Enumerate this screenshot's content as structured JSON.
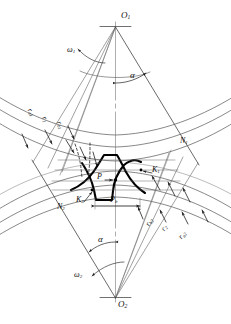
{
  "figure": {
    "type": "engineering-diagram",
    "centers": {
      "top": "O",
      "top_sub": "1",
      "bottom": "O",
      "bottom_sub": "2"
    },
    "labels": {
      "o1": "O",
      "o1_sub": "1",
      "o2": "O",
      "o2_sub": "2",
      "omega1": "ω",
      "omega1_sub": "1",
      "omega2": "ω",
      "omega2_sub": "2",
      "alpha_top": "α",
      "alpha_bottom": "α",
      "n1": "N",
      "n1_sub": "1",
      "n2": "N",
      "n2_sub": "2",
      "k1": "K",
      "k1_sub": "1",
      "k2": "K",
      "k2_sub": "2",
      "p": "P",
      "pb": "P",
      "pb_sub": "b",
      "ra1": "r",
      "ra1_sub": "a1",
      "r1": "r",
      "r1_sub": "1",
      "rb1": "r",
      "rb1_sub": "b1",
      "rb2": "r",
      "rb2_sub": "b2",
      "r2": "r",
      "r2_sub": "2",
      "ra2": "r",
      "ra2_sub": "a2"
    },
    "colors": {
      "line": "#1a1a1a",
      "thin": "#4a4a4a",
      "background": "#ffffff"
    }
  }
}
